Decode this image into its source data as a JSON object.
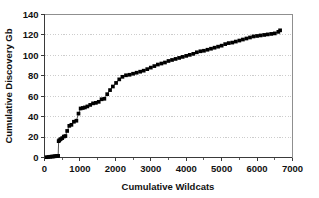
{
  "chart_data": {
    "type": "scatter",
    "title": "",
    "xlabel": "Cumulative Wildcats",
    "ylabel": "Cumulative Discovery Gb",
    "xlim": [
      0,
      7000
    ],
    "ylim": [
      0,
      140
    ],
    "xticks": [
      0,
      1000,
      2000,
      3000,
      4000,
      5000,
      6000,
      7000
    ],
    "xticklabels": [
      "0",
      "1000",
      "2000",
      "3000",
      "4000",
      "5000",
      "6000",
      "7000"
    ],
    "yticks": [
      0,
      20,
      40,
      60,
      80,
      100,
      120,
      140
    ],
    "yticklabels": [
      "0",
      "20",
      "40",
      "60",
      "80",
      "100",
      "120",
      "140"
    ],
    "x_minor_tick_interval": 500,
    "grid": "horizontal-dashed",
    "legend": "none",
    "marker": "filled-square",
    "marker_color": "#000000",
    "line_color": "#2b2b2b",
    "series": [
      {
        "name": "Cumulative Discovery",
        "x": [
          60,
          110,
          160,
          205,
          250,
          290,
          330,
          360,
          385,
          400,
          420,
          455,
          500,
          545,
          590,
          640,
          700,
          760,
          830,
          900,
          960,
          1020,
          1080,
          1140,
          1210,
          1290,
          1370,
          1450,
          1530,
          1610,
          1690,
          1770,
          1850,
          1930,
          2020,
          2110,
          2200,
          2300,
          2400,
          2500,
          2600,
          2700,
          2800,
          2900,
          3000,
          3100,
          3200,
          3300,
          3400,
          3500,
          3600,
          3700,
          3800,
          3900,
          4000,
          4100,
          4200,
          4300,
          4400,
          4500,
          4600,
          4700,
          4800,
          4900,
          5000,
          5100,
          5200,
          5300,
          5400,
          5500,
          5600,
          5700,
          5800,
          5900,
          6000,
          6100,
          6200,
          6300,
          6400,
          6500,
          6600,
          6650
        ],
        "y": [
          0.3,
          0.5,
          0.7,
          0.9,
          1.0,
          1.2,
          1.4,
          1.5,
          1.6,
          16.0,
          17.0,
          18.0,
          19.0,
          20.5,
          21.0,
          26.0,
          31.0,
          32.0,
          35.0,
          36.0,
          43.0,
          48.0,
          48.5,
          49.0,
          50.0,
          51.5,
          53.0,
          53.5,
          54.5,
          57.0,
          57.5,
          62.0,
          66.0,
          69.5,
          73.0,
          76.5,
          79.0,
          80.5,
          81.0,
          82.0,
          83.0,
          84.0,
          85.0,
          86.5,
          88.0,
          89.5,
          91.0,
          92.0,
          93.0,
          94.5,
          95.5,
          96.5,
          97.5,
          98.5,
          99.5,
          100.5,
          101.5,
          103.0,
          104.0,
          104.5,
          105.5,
          106.5,
          107.5,
          108.5,
          109.5,
          111.0,
          112.0,
          112.5,
          113.5,
          114.5,
          115.5,
          116.5,
          117.5,
          118.5,
          119.0,
          119.5,
          120.0,
          120.5,
          121.0,
          121.5,
          123.0,
          124.5
        ]
      }
    ]
  },
  "artifact": {
    "bottom_smudge": ""
  }
}
